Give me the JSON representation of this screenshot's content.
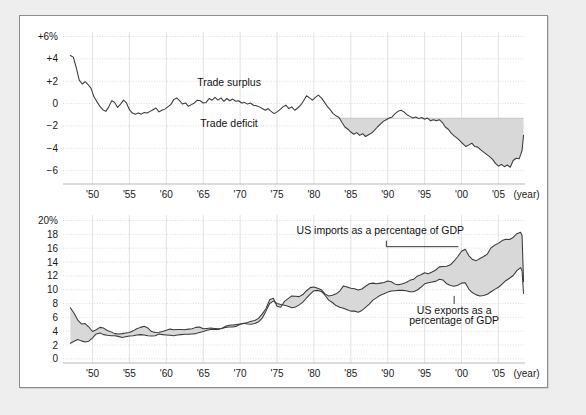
{
  "figure": {
    "panel_name": "trade-figure-panel",
    "background": "#eeeeee",
    "panel_background": "#ffffff",
    "border_color": "#8b8b8b"
  },
  "chart_data": [
    {
      "id": "trade-balance",
      "type": "area",
      "title": "",
      "xlabel": "(year)",
      "ylabel": "",
      "ylim": [
        -7.2,
        6.4
      ],
      "xlim": [
        1946.0,
        2008.6
      ],
      "grid": true,
      "legend": "annotations",
      "y_ticks": [
        6,
        4,
        2,
        0,
        -2,
        -4,
        -6
      ],
      "y_tick_labels": [
        "+6%",
        "+4",
        "+2",
        "0",
        "−2",
        "−4",
        "−6"
      ],
      "x_ticks": [
        1950,
        1955,
        1960,
        1965,
        1970,
        1975,
        1980,
        1985,
        1990,
        1995,
        2000,
        2005
      ],
      "x_tick_labels": [
        "'50",
        "'55",
        "'60",
        "'65",
        "'70",
        "'75",
        "'80",
        "'85",
        "'90",
        "'95",
        "'00",
        "'05"
      ],
      "x_axis_suffix": "(year)",
      "annotations": [
        {
          "text": "Trade surplus",
          "x": 1968.5,
          "y": 1.55
        },
        {
          "text": "Trade deficit",
          "x": 1968.5,
          "y": -2.1
        }
      ],
      "shading": {
        "label": "deficit-shading",
        "color": "#d6d6d6",
        "baseline": -1.32,
        "start_year": 1982.2,
        "end_year": 2008.4
      },
      "series": [
        {
          "name": "US trade balance as a percentage of GDP",
          "color": "#3a3a3a",
          "x": [
            1947.0,
            1947.4,
            1947.8,
            1948.2,
            1948.6,
            1949.0,
            1949.4,
            1949.8,
            1950.2,
            1950.6,
            1951.0,
            1951.4,
            1951.8,
            1952.2,
            1952.6,
            1953.0,
            1953.4,
            1953.8,
            1954.2,
            1954.6,
            1955.0,
            1955.4,
            1955.8,
            1956.2,
            1956.6,
            1957.0,
            1957.4,
            1957.8,
            1958.2,
            1958.6,
            1959.0,
            1959.4,
            1959.8,
            1960.2,
            1960.6,
            1961.0,
            1961.4,
            1961.8,
            1962.2,
            1962.6,
            1963.0,
            1963.4,
            1963.8,
            1964.2,
            1964.6,
            1965.0,
            1965.4,
            1965.8,
            1966.2,
            1966.6,
            1967.0,
            1967.4,
            1967.8,
            1968.2,
            1968.6,
            1969.0,
            1969.4,
            1969.8,
            1970.2,
            1970.6,
            1971.0,
            1971.4,
            1971.8,
            1972.2,
            1972.6,
            1973.0,
            1973.4,
            1973.8,
            1974.2,
            1974.6,
            1975.0,
            1975.4,
            1975.8,
            1976.2,
            1976.6,
            1977.0,
            1977.4,
            1977.8,
            1978.2,
            1978.6,
            1979.0,
            1979.4,
            1979.8,
            1980.2,
            1980.6,
            1981.0,
            1981.4,
            1981.8,
            1982.2,
            1982.6,
            1983.0,
            1983.4,
            1983.8,
            1984.2,
            1984.6,
            1985.0,
            1985.4,
            1985.8,
            1986.2,
            1986.6,
            1987.0,
            1987.4,
            1987.8,
            1988.2,
            1988.6,
            1989.0,
            1989.4,
            1989.8,
            1990.2,
            1990.6,
            1991.0,
            1991.4,
            1991.8,
            1992.2,
            1992.6,
            1993.0,
            1993.4,
            1993.8,
            1994.2,
            1994.6,
            1995.0,
            1995.4,
            1995.8,
            1996.2,
            1996.6,
            1997.0,
            1997.4,
            1997.8,
            1998.2,
            1998.6,
            1999.0,
            1999.4,
            1999.8,
            2000.2,
            2000.6,
            2001.0,
            2001.4,
            2001.8,
            2002.2,
            2002.6,
            2003.0,
            2003.4,
            2003.8,
            2004.2,
            2004.6,
            2005.0,
            2005.4,
            2005.8,
            2006.2,
            2006.6,
            2007.0,
            2007.4,
            2007.8,
            2008.0,
            2008.2,
            2008.4
          ],
          "y": [
            4.3,
            4.15,
            3.2,
            2.1,
            1.75,
            1.95,
            1.7,
            1.35,
            0.6,
            0.15,
            -0.25,
            -0.55,
            -0.7,
            -0.3,
            0.25,
            0.1,
            -0.35,
            -0.05,
            0.3,
            0.05,
            -0.55,
            -0.85,
            -0.95,
            -0.85,
            -0.95,
            -0.8,
            -0.85,
            -0.7,
            -0.55,
            -0.4,
            -0.75,
            -0.6,
            -0.5,
            -0.3,
            -0.1,
            0.35,
            0.5,
            0.25,
            -0.05,
            0.05,
            -0.25,
            -0.1,
            0.05,
            0.3,
            0.25,
            0.05,
            0.1,
            0.45,
            0.3,
            0.55,
            0.3,
            0.5,
            0.2,
            0.45,
            0.25,
            0.4,
            0.2,
            0.25,
            0.05,
            0.1,
            -0.05,
            0.05,
            -0.15,
            -0.2,
            -0.3,
            -0.45,
            -0.6,
            -0.45,
            -0.7,
            -0.9,
            -0.75,
            -0.55,
            -0.3,
            -0.15,
            -0.45,
            -0.3,
            -0.6,
            -0.4,
            -0.15,
            0.25,
            0.7,
            0.5,
            0.3,
            0.55,
            0.75,
            0.5,
            0.15,
            -0.25,
            -0.55,
            -0.9,
            -1.1,
            -1.25,
            -1.7,
            -2.1,
            -2.3,
            -2.55,
            -2.75,
            -2.6,
            -2.85,
            -2.7,
            -2.95,
            -2.8,
            -2.65,
            -2.4,
            -2.1,
            -1.85,
            -1.6,
            -1.45,
            -1.3,
            -1.2,
            -0.9,
            -0.7,
            -0.6,
            -0.75,
            -1.0,
            -1.15,
            -1.3,
            -1.2,
            -1.35,
            -1.25,
            -1.4,
            -1.3,
            -1.55,
            -1.45,
            -1.55,
            -1.45,
            -1.7,
            -2.1,
            -2.3,
            -2.65,
            -2.9,
            -3.1,
            -3.35,
            -3.6,
            -3.85,
            -3.7,
            -3.55,
            -3.85,
            -3.9,
            -4.15,
            -4.35,
            -4.55,
            -4.75,
            -5.0,
            -5.35,
            -5.6,
            -5.45,
            -5.65,
            -5.5,
            -5.7,
            -5.1,
            -4.9,
            -4.95,
            -4.6,
            -4.2,
            -2.85
          ]
        }
      ]
    },
    {
      "id": "imports-exports-gdp",
      "type": "area",
      "title": "",
      "xlabel": "(year)",
      "ylabel": "",
      "ylim": [
        -0.6,
        20.8
      ],
      "xlim": [
        1946.0,
        2008.6
      ],
      "grid": true,
      "legend": "annotations",
      "y_ticks": [
        20,
        18,
        16,
        14,
        12,
        10,
        8,
        6,
        4,
        2,
        0
      ],
      "y_tick_labels": [
        "20%",
        "18",
        "16",
        "14",
        "12",
        "10",
        "8",
        "6",
        "4",
        "2",
        "0"
      ],
      "x_ticks": [
        1950,
        1955,
        1960,
        1965,
        1970,
        1975,
        1980,
        1985,
        1990,
        1995,
        2000,
        2005
      ],
      "x_tick_labels": [
        "'50",
        "'55",
        "'60",
        "'65",
        "'70",
        "'75",
        "'80",
        "'85",
        "'90",
        "'95",
        "'00",
        "'05"
      ],
      "x_axis_suffix": "(year)",
      "annotations": [
        {
          "text": "US imports as a percentage of GDP",
          "x": 1989.0,
          "y": 18.1,
          "leader": true
        },
        {
          "text": "US exports as a",
          "x": 1999.0,
          "y": 6.5
        },
        {
          "text": "percentage of GDP",
          "x": 1999.0,
          "y": 5.1
        }
      ],
      "shading": {
        "label": "import-export-gap-shading",
        "color": "#d6d6d6"
      },
      "series": [
        {
          "name": "US imports as a percentage of GDP",
          "color": "#3a3a3a",
          "x": [
            1947.0,
            1947.5,
            1948.0,
            1948.5,
            1949.0,
            1949.5,
            1950.0,
            1950.5,
            1951.0,
            1951.5,
            1952.0,
            1952.5,
            1953.0,
            1953.5,
            1954.0,
            1954.5,
            1955.0,
            1955.5,
            1956.0,
            1956.5,
            1957.0,
            1957.5,
            1958.0,
            1958.5,
            1959.0,
            1959.5,
            1960.0,
            1960.5,
            1961.0,
            1961.5,
            1962.0,
            1962.5,
            1963.0,
            1963.5,
            1964.0,
            1964.5,
            1965.0,
            1965.5,
            1966.0,
            1966.5,
            1967.0,
            1967.5,
            1968.0,
            1968.5,
            1969.0,
            1969.5,
            1970.0,
            1970.5,
            1971.0,
            1971.5,
            1972.0,
            1972.5,
            1973.0,
            1973.5,
            1974.0,
            1974.5,
            1975.0,
            1975.5,
            1976.0,
            1976.5,
            1977.0,
            1977.5,
            1978.0,
            1978.5,
            1979.0,
            1979.5,
            1980.0,
            1980.5,
            1981.0,
            1981.5,
            1982.0,
            1982.5,
            1983.0,
            1983.5,
            1984.0,
            1984.5,
            1985.0,
            1985.5,
            1986.0,
            1986.5,
            1987.0,
            1987.5,
            1988.0,
            1988.5,
            1989.0,
            1989.5,
            1990.0,
            1990.5,
            1991.0,
            1991.5,
            1992.0,
            1992.5,
            1993.0,
            1993.5,
            1994.0,
            1994.5,
            1995.0,
            1995.5,
            1996.0,
            1996.5,
            1997.0,
            1997.5,
            1998.0,
            1998.5,
            1999.0,
            1999.5,
            2000.0,
            2000.5,
            2001.0,
            2001.5,
            2002.0,
            2002.5,
            2003.0,
            2003.5,
            2004.0,
            2004.5,
            2005.0,
            2005.5,
            2006.0,
            2006.5,
            2007.0,
            2007.5,
            2008.0,
            2008.2,
            2008.4
          ],
          "y": [
            2.25,
            2.55,
            2.8,
            2.6,
            2.45,
            2.55,
            3.05,
            3.6,
            3.75,
            3.5,
            3.4,
            3.35,
            3.35,
            3.25,
            3.1,
            3.2,
            3.3,
            3.35,
            3.45,
            3.5,
            3.45,
            3.35,
            3.3,
            3.35,
            3.6,
            3.5,
            3.45,
            3.4,
            3.35,
            3.45,
            3.5,
            3.55,
            3.55,
            3.6,
            3.65,
            3.8,
            3.95,
            4.15,
            4.25,
            4.3,
            4.25,
            4.4,
            4.7,
            4.85,
            4.9,
            4.95,
            5.05,
            5.1,
            5.25,
            5.45,
            5.55,
            5.85,
            6.5,
            7.25,
            8.55,
            8.75,
            7.6,
            7.45,
            8.3,
            8.7,
            9.1,
            9.05,
            9.0,
            9.3,
            9.85,
            10.3,
            10.4,
            10.2,
            10.0,
            9.4,
            9.1,
            9.2,
            9.4,
            9.8,
            10.55,
            10.4,
            10.2,
            10.15,
            9.95,
            10.1,
            10.5,
            10.85,
            10.95,
            10.85,
            10.95,
            11.05,
            11.25,
            11.15,
            10.8,
            10.7,
            10.85,
            11.05,
            11.35,
            11.5,
            11.95,
            12.15,
            12.45,
            12.3,
            12.55,
            12.85,
            13.3,
            13.35,
            13.4,
            13.6,
            14.15,
            14.8,
            15.55,
            15.85,
            14.9,
            14.35,
            14.2,
            14.5,
            14.8,
            15.15,
            16.05,
            16.45,
            16.7,
            17.1,
            17.3,
            17.25,
            17.55,
            18.1,
            18.3,
            17.85,
            11.2
          ]
        },
        {
          "name": "US exports as a percentage of GDP",
          "color": "#3a3a3a",
          "x": [
            1947.0,
            1947.5,
            1948.0,
            1948.5,
            1949.0,
            1949.5,
            1950.0,
            1950.5,
            1951.0,
            1951.5,
            1952.0,
            1952.5,
            1953.0,
            1953.5,
            1954.0,
            1954.5,
            1955.0,
            1955.5,
            1956.0,
            1956.5,
            1957.0,
            1957.5,
            1958.0,
            1958.5,
            1959.0,
            1959.5,
            1960.0,
            1960.5,
            1961.0,
            1961.5,
            1962.0,
            1962.5,
            1963.0,
            1963.5,
            1964.0,
            1964.5,
            1965.0,
            1965.5,
            1966.0,
            1966.5,
            1967.0,
            1967.5,
            1968.0,
            1968.5,
            1969.0,
            1969.5,
            1970.0,
            1970.5,
            1971.0,
            1971.5,
            1972.0,
            1972.5,
            1973.0,
            1973.5,
            1974.0,
            1974.5,
            1975.0,
            1975.5,
            1976.0,
            1976.5,
            1977.0,
            1977.5,
            1978.0,
            1978.5,
            1979.0,
            1979.5,
            1980.0,
            1980.5,
            1981.0,
            1981.5,
            1982.0,
            1982.5,
            1983.0,
            1983.5,
            1984.0,
            1984.5,
            1985.0,
            1985.5,
            1986.0,
            1986.5,
            1987.0,
            1987.5,
            1988.0,
            1988.5,
            1989.0,
            1989.5,
            1990.0,
            1990.5,
            1991.0,
            1991.5,
            1992.0,
            1992.5,
            1993.0,
            1993.5,
            1994.0,
            1994.5,
            1995.0,
            1995.5,
            1996.0,
            1996.5,
            1997.0,
            1997.5,
            1998.0,
            1998.5,
            1999.0,
            1999.5,
            2000.0,
            2000.5,
            2001.0,
            2001.5,
            2002.0,
            2002.5,
            2003.0,
            2003.5,
            2004.0,
            2004.5,
            2005.0,
            2005.5,
            2006.0,
            2006.5,
            2007.0,
            2007.5,
            2008.0,
            2008.2,
            2008.4
          ],
          "y": [
            7.4,
            6.6,
            5.6,
            5.05,
            5.1,
            4.6,
            3.95,
            4.2,
            4.55,
            4.45,
            4.1,
            3.9,
            3.65,
            3.6,
            3.65,
            3.75,
            3.8,
            4.05,
            4.35,
            4.55,
            4.7,
            4.45,
            3.95,
            3.8,
            3.85,
            3.95,
            4.15,
            4.3,
            4.2,
            4.25,
            4.25,
            4.2,
            4.3,
            4.35,
            4.55,
            4.6,
            4.35,
            4.4,
            4.45,
            4.4,
            4.35,
            4.4,
            4.55,
            4.6,
            4.6,
            4.7,
            5.0,
            5.15,
            5.05,
            5.0,
            5.1,
            5.35,
            5.9,
            6.9,
            8.0,
            8.35,
            8.0,
            7.85,
            7.75,
            7.6,
            7.4,
            7.5,
            7.8,
            8.2,
            8.8,
            9.35,
            9.85,
            9.9,
            9.75,
            9.2,
            8.5,
            8.15,
            7.7,
            7.45,
            7.3,
            7.1,
            6.9,
            6.9,
            6.75,
            7.0,
            7.45,
            7.9,
            8.5,
            8.85,
            9.2,
            9.4,
            9.65,
            9.8,
            9.85,
            9.9,
            9.9,
            9.85,
            9.7,
            9.7,
            9.95,
            10.35,
            10.85,
            11.0,
            11.1,
            11.2,
            11.5,
            11.4,
            10.85,
            10.6,
            10.5,
            10.65,
            10.95,
            11.0,
            10.05,
            9.55,
            9.25,
            9.1,
            9.15,
            9.35,
            9.7,
            10.05,
            10.35,
            10.8,
            11.3,
            11.65,
            12.05,
            12.75,
            13.2,
            12.75,
            9.45
          ]
        }
      ]
    }
  ]
}
